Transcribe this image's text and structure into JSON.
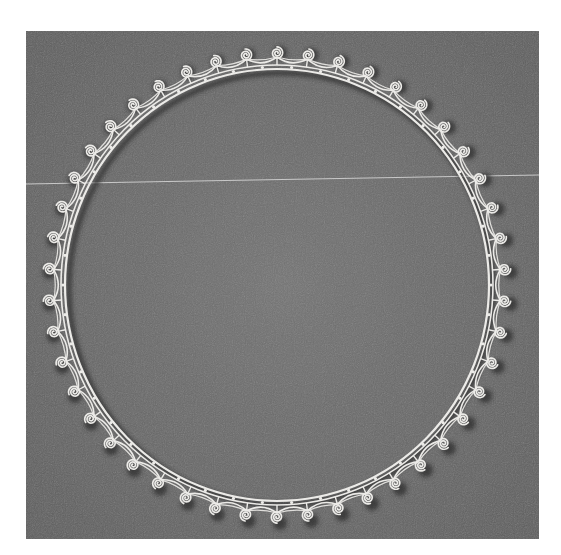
{
  "image": {
    "description": "Photograph of a circular quilled paper border with scroll/spiral motifs on a gray textured background",
    "alt": "Circular quilled paper scroll border"
  },
  "colors": {
    "page_background": "#ffffff",
    "panel_background": "#6e6e6e",
    "panel_shade": "#626262",
    "paper": "#ecebe8",
    "shadow": "#2e2e2e",
    "scan_line": "#d8d8d8"
  },
  "panel": {
    "x": 26,
    "y": 31,
    "width": 513,
    "height": 508
  },
  "scan_line": {
    "x1": 26,
    "y1": 184,
    "x2": 539,
    "y2": 175
  },
  "ring": {
    "center_x": 277,
    "center_y": 285,
    "radius_x": 212,
    "radius_y": 216,
    "spiral_count": 46,
    "spiral_offset": 16
  }
}
